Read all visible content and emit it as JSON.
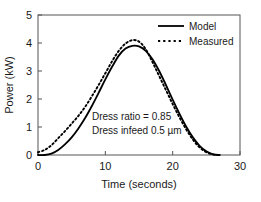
{
  "chart_data": {
    "type": "line",
    "title": "",
    "xlabel": "Time (seconds)",
    "ylabel": "Power (kW)",
    "xlim": [
      0,
      30
    ],
    "ylim": [
      0,
      5
    ],
    "xticks": [
      0,
      10,
      20,
      30
    ],
    "yticks": [
      0,
      1,
      2,
      3,
      4,
      5
    ],
    "xtick_labels": [
      "0",
      "10",
      "20",
      "30"
    ],
    "ytick_labels": [
      "0",
      "1",
      "2",
      "3",
      "4",
      "5"
    ],
    "grid": false,
    "frame": "box",
    "legend_position": "top-right",
    "series": [
      {
        "name": "Model",
        "style": "solid",
        "color": "#000000",
        "x": [
          0,
          1,
          2,
          3,
          4,
          5,
          6,
          7,
          8,
          9,
          10,
          11,
          12,
          13,
          14,
          15,
          16,
          17,
          18,
          19,
          20,
          21,
          22,
          23,
          24,
          25,
          26,
          27
        ],
        "y": [
          0.0,
          0.0,
          0.05,
          0.18,
          0.38,
          0.63,
          0.95,
          1.32,
          1.75,
          2.22,
          2.7,
          3.15,
          3.55,
          3.8,
          3.9,
          3.88,
          3.72,
          3.42,
          3.0,
          2.5,
          1.98,
          1.48,
          1.02,
          0.63,
          0.33,
          0.13,
          0.02,
          0.0
        ]
      },
      {
        "name": "Measured",
        "style": "dotted",
        "color": "#000000",
        "x": [
          0,
          1,
          2,
          3,
          4,
          5,
          6,
          7,
          8,
          9,
          10,
          11,
          12,
          13,
          14,
          15,
          16,
          17,
          18,
          19,
          20,
          21,
          22,
          23,
          24,
          25,
          26,
          27
        ],
        "y": [
          0.1,
          0.18,
          0.35,
          0.6,
          0.85,
          1.12,
          1.4,
          1.72,
          2.1,
          2.5,
          2.92,
          3.35,
          3.72,
          3.98,
          4.1,
          4.05,
          3.78,
          3.32,
          2.82,
          2.32,
          1.82,
          1.35,
          0.92,
          0.55,
          0.27,
          0.1,
          0.02,
          0.0
        ]
      }
    ],
    "annotations": [
      "Dress ratio = 0.85",
      "Dress infeed 0.5 µm"
    ]
  },
  "legend": {
    "entries": [
      {
        "label": "Model"
      },
      {
        "label": "Measured"
      }
    ]
  }
}
